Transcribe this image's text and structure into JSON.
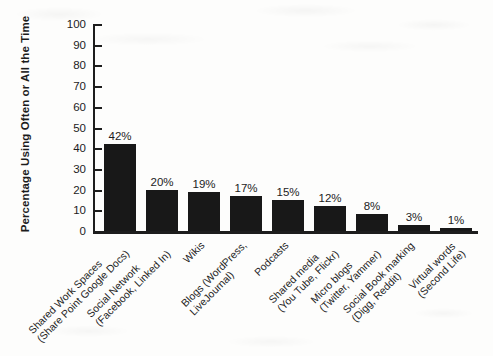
{
  "chart_data": {
    "type": "bar",
    "title": "",
    "xlabel": "",
    "ylabel": "Percentage Using Often or All the Time",
    "ylim": [
      0,
      100
    ],
    "ytick_step": 10,
    "yticks": [
      0,
      10,
      20,
      30,
      40,
      50,
      60,
      70,
      80,
      90,
      100
    ],
    "grid": false,
    "legend": "none",
    "categories": [
      "Shared Work Spaces (Share Point Google Docs)",
      "Social Network (Facebook, Linked In)",
      "Wikis",
      "Blogs (WordPress, LiveJournal)",
      "Podcasts",
      "Shared media (You Tube, Flickr)",
      "Micro blogs (Twitter, Yammer)",
      "Social Book marking (Digg, Reddit)",
      "Virtual words (Second Life)"
    ],
    "category_lines": [
      [
        "Shared Work  Spaces",
        "(Share Point Google Docs)"
      ],
      [
        "Social Network",
        "(Facebook, Linked In)"
      ],
      [
        "Wikis",
        ""
      ],
      [
        "Blogs (WordPress,",
        "LiveJournal)"
      ],
      [
        "Podcasts",
        ""
      ],
      [
        "Shared media",
        "(You Tube, Flickr)"
      ],
      [
        "Micro blogs",
        "(Twitter, Yammer)"
      ],
      [
        "Social Book marking",
        "(Digg, Reddit)"
      ],
      [
        "Virtual words",
        "(Second Life)"
      ]
    ],
    "values": [
      42,
      20,
      19,
      17,
      15,
      12,
      8,
      3,
      1
    ],
    "value_labels": [
      "42%",
      "20%",
      "19%",
      "17%",
      "15%",
      "12%",
      "8%",
      "3%",
      "1%"
    ],
    "bar_color": "#181818",
    "axis_color": "#1d1d1d",
    "text_color": "#1c1c1c",
    "background": "#fdfdfc"
  }
}
